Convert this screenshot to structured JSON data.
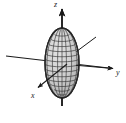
{
  "figure": {
    "kind": "3d-axes-with-ellipsoid",
    "caption": "",
    "background_color": "#ffffff",
    "stroke_color": "#1a1a1a",
    "mesh_color": "#3a3a3a",
    "surface_fill": "#c8c8c8",
    "width_px": 126,
    "height_px": 123
  },
  "axes": {
    "origin": {
      "x": 62,
      "y": 63
    },
    "z": {
      "label": "z",
      "label_position": {
        "x": 54,
        "y": 1
      },
      "direction": "up",
      "arrow": true,
      "start": {
        "x": 62,
        "y": 104
      },
      "end": {
        "x": 62,
        "y": 8
      }
    },
    "y": {
      "label": "y",
      "label_position": {
        "x": 116,
        "y": 69
      },
      "direction": "right",
      "arrow": true,
      "start": {
        "x": 6,
        "y": 56
      },
      "end": {
        "x": 116,
        "y": 69
      }
    },
    "x": {
      "label": "x",
      "label_position": {
        "x": 31,
        "y": 92
      },
      "direction": "lower-left",
      "arrow": true,
      "start": {
        "x": 66,
        "y": 65
      },
      "end": {
        "x": 36,
        "y": 89
      }
    }
  },
  "ellipsoid": {
    "name": "prolate-ellipsoid-wireframe",
    "center": {
      "x": 62,
      "y": 63
    },
    "semi_axis_horizontal_px": 17,
    "semi_axis_vertical_px": 35,
    "mesh_meridians": 9,
    "mesh_parallels": 13,
    "elongated_along": "z"
  },
  "pointer": {
    "name": "surface-pointer-line",
    "start": {
      "x": 96,
      "y": 37
    },
    "end": {
      "x": 76,
      "y": 52
    },
    "arrow": false
  }
}
